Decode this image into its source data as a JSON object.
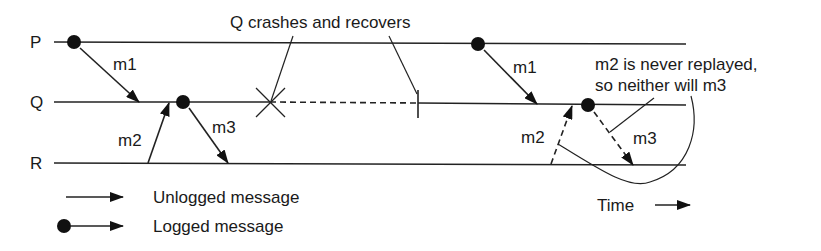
{
  "diagram": {
    "processes": [
      {
        "id": "P",
        "label": "P"
      },
      {
        "id": "Q",
        "label": "Q"
      },
      {
        "id": "R",
        "label": "R"
      }
    ],
    "messages": [
      {
        "label": "m1",
        "from": "P",
        "to": "Q",
        "logged": true,
        "phase": "before-crash"
      },
      {
        "label": "m2",
        "from": "R",
        "to": "Q",
        "logged": false,
        "phase": "before-crash"
      },
      {
        "label": "m3",
        "from": "Q",
        "to": "R",
        "logged": true,
        "phase": "before-crash"
      },
      {
        "label": "m1",
        "from": "P",
        "to": "Q",
        "logged": true,
        "phase": "replay"
      },
      {
        "label": "m2",
        "from": "R",
        "to": "Q",
        "logged": false,
        "phase": "replay",
        "style": "dashed"
      },
      {
        "label": "m3",
        "from": "Q",
        "to": "R",
        "logged": true,
        "phase": "replay",
        "style": "dashed"
      }
    ],
    "annotations": {
      "crash": "Q crashes and recovers",
      "note_line1": "m2 is never replayed,",
      "note_line2": "so neither will m3",
      "time": "Time"
    },
    "legend": [
      {
        "label": "Unlogged message",
        "symbol": "arrow"
      },
      {
        "label": "Logged message",
        "symbol": "dot-arrow"
      }
    ]
  }
}
